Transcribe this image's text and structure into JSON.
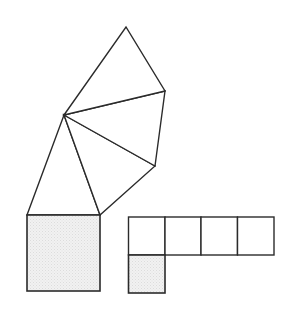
{
  "diagram": {
    "title": "",
    "colors": {
      "stroke": "#2b2b2b",
      "shade": "#efefef",
      "background": "#ffffff"
    },
    "fan": {
      "hub": [
        64,
        115
      ],
      "triangles": [
        {
          "name": "triangle-bottom-left",
          "points": [
            [
              27,
              215
            ],
            [
              64,
              115
            ],
            [
              100,
              215
            ]
          ]
        },
        {
          "name": "triangle-lower-middle",
          "points": [
            [
              64,
              115
            ],
            [
              100,
              215
            ],
            [
              155,
              166
            ]
          ]
        },
        {
          "name": "triangle-upper-middle",
          "points": [
            [
              64,
              115
            ],
            [
              155,
              166
            ],
            [
              165,
              91
            ]
          ]
        },
        {
          "name": "triangle-top",
          "points": [
            [
              64,
              115
            ],
            [
              165,
              91
            ],
            [
              126,
              27
            ]
          ]
        }
      ]
    },
    "big_square": {
      "x": 27,
      "y": 215,
      "w": 73,
      "h": 76,
      "shaded": true
    },
    "grid": {
      "cells": [
        {
          "x": 128.5,
          "y": 217,
          "w": 36.5,
          "h": 38,
          "shaded": false
        },
        {
          "x": 165,
          "y": 217,
          "w": 36,
          "h": 38,
          "shaded": false
        },
        {
          "x": 201,
          "y": 217,
          "w": 36.5,
          "h": 38,
          "shaded": false
        },
        {
          "x": 237.5,
          "y": 217,
          "w": 36.5,
          "h": 38,
          "shaded": false
        },
        {
          "x": 128.5,
          "y": 255,
          "w": 36.5,
          "h": 38,
          "shaded": true
        }
      ]
    }
  }
}
